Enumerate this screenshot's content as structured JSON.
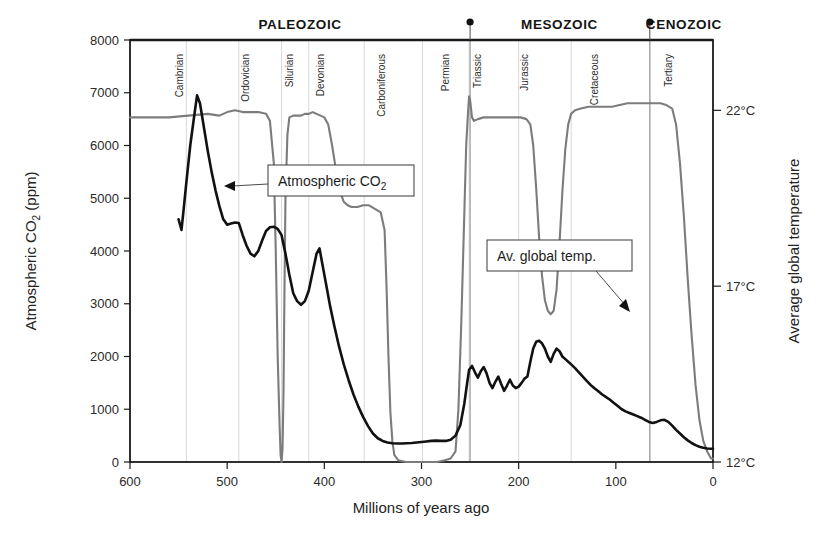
{
  "chart_data": {
    "type": "line",
    "title": "",
    "xlabel": "Millions of years ago",
    "ylabel": "Atmospheric CO₂ (ppm)",
    "ylabel_right": "Average global temperature",
    "xlim": [
      600,
      0
    ],
    "ylim": [
      0,
      8000
    ],
    "ylim_right": [
      12,
      24
    ],
    "x_reversed": true,
    "grid": true,
    "legend_position": "inline-callouts",
    "xticks": [
      600,
      500,
      400,
      300,
      200,
      100,
      0
    ],
    "xtick_labels": [
      "600",
      "500",
      "400",
      "300",
      "200",
      "100",
      "0"
    ],
    "yticks": [
      0,
      1000,
      2000,
      3000,
      4000,
      5000,
      6000,
      7000,
      8000
    ],
    "ytick_labels": [
      "0",
      "1000",
      "2000",
      "3000",
      "4000",
      "5000",
      "6000",
      "7000",
      "8000"
    ],
    "yticks_right": [
      12,
      17,
      22
    ],
    "ytick_labels_right": [
      "12°C",
      "17°C",
      "22°C"
    ],
    "eras": [
      {
        "name": "PALEOZOIC",
        "start": 600,
        "end": 250,
        "label_x": 425
      },
      {
        "name": "MESOZOIC",
        "start": 250,
        "end": 65,
        "label_x": 158
      },
      {
        "name": "CENOZOIC",
        "start": 65,
        "end": 0,
        "label_x": 30
      }
    ],
    "era_boundary_markers": [
      250,
      65
    ],
    "periods": [
      {
        "name": "Cambrian",
        "start": 542,
        "end": 488,
        "label_x": 545
      },
      {
        "name": "Ordovician",
        "start": 488,
        "end": 444,
        "label_x": 478
      },
      {
        "name": "Silurian",
        "start": 444,
        "end": 416,
        "label_x": 432
      },
      {
        "name": "Devonian",
        "start": 416,
        "end": 359,
        "label_x": 400
      },
      {
        "name": "Carboniferous",
        "start": 359,
        "end": 299,
        "label_x": 338
      },
      {
        "name": "Permian",
        "start": 299,
        "end": 251,
        "label_x": 272
      },
      {
        "name": "Triassic",
        "start": 251,
        "end": 200,
        "label_x": 239
      },
      {
        "name": "Jurassic",
        "start": 200,
        "end": 146,
        "label_x": 190
      },
      {
        "name": "Cretaceous",
        "start": 146,
        "end": 65,
        "label_x": 118
      },
      {
        "name": "Tertiary",
        "start": 65,
        "end": 2,
        "label_x": 42
      }
    ],
    "period_boundaries": [
      542,
      488,
      444,
      416,
      359,
      299,
      251,
      200,
      146,
      65
    ],
    "series": [
      {
        "name": "Atmospheric CO₂",
        "unit": "ppm",
        "axis": "left",
        "color": "#111111",
        "points": [
          [
            550,
            4600
          ],
          [
            547,
            4400
          ],
          [
            545,
            4750
          ],
          [
            542,
            5300
          ],
          [
            538,
            6000
          ],
          [
            534,
            6550
          ],
          [
            531,
            6950
          ],
          [
            528,
            6800
          ],
          [
            524,
            6350
          ],
          [
            520,
            5900
          ],
          [
            516,
            5500
          ],
          [
            512,
            5150
          ],
          [
            508,
            4850
          ],
          [
            504,
            4600
          ],
          [
            500,
            4500
          ],
          [
            496,
            4520
          ],
          [
            492,
            4540
          ],
          [
            488,
            4530
          ],
          [
            484,
            4300
          ],
          [
            480,
            4100
          ],
          [
            476,
            3950
          ],
          [
            472,
            3900
          ],
          [
            468,
            4000
          ],
          [
            464,
            4200
          ],
          [
            460,
            4380
          ],
          [
            456,
            4450
          ],
          [
            452,
            4460
          ],
          [
            448,
            4420
          ],
          [
            444,
            4300
          ],
          [
            440,
            3950
          ],
          [
            436,
            3550
          ],
          [
            432,
            3200
          ],
          [
            428,
            3050
          ],
          [
            424,
            2980
          ],
          [
            420,
            3050
          ],
          [
            416,
            3250
          ],
          [
            412,
            3600
          ],
          [
            408,
            3950
          ],
          [
            405,
            4050
          ],
          [
            402,
            3750
          ],
          [
            398,
            3350
          ],
          [
            394,
            2950
          ],
          [
            390,
            2600
          ],
          [
            385,
            2200
          ],
          [
            380,
            1850
          ],
          [
            375,
            1550
          ],
          [
            370,
            1280
          ],
          [
            365,
            1050
          ],
          [
            360,
            850
          ],
          [
            355,
            680
          ],
          [
            350,
            540
          ],
          [
            345,
            450
          ],
          [
            340,
            400
          ],
          [
            335,
            370
          ],
          [
            330,
            355
          ],
          [
            325,
            350
          ],
          [
            320,
            350
          ],
          [
            315,
            355
          ],
          [
            310,
            360
          ],
          [
            305,
            370
          ],
          [
            300,
            380
          ],
          [
            295,
            390
          ],
          [
            290,
            400
          ],
          [
            285,
            405
          ],
          [
            280,
            400
          ],
          [
            275,
            400
          ],
          [
            270,
            420
          ],
          [
            265,
            500
          ],
          [
            260,
            700
          ],
          [
            256,
            1100
          ],
          [
            253,
            1500
          ],
          [
            251,
            1750
          ],
          [
            248,
            1820
          ],
          [
            245,
            1700
          ],
          [
            242,
            1600
          ],
          [
            239,
            1720
          ],
          [
            236,
            1800
          ],
          [
            233,
            1680
          ],
          [
            230,
            1500
          ],
          [
            227,
            1400
          ],
          [
            224,
            1520
          ],
          [
            221,
            1620
          ],
          [
            218,
            1480
          ],
          [
            215,
            1350
          ],
          [
            212,
            1450
          ],
          [
            209,
            1560
          ],
          [
            206,
            1450
          ],
          [
            203,
            1400
          ],
          [
            200,
            1430
          ],
          [
            197,
            1500
          ],
          [
            194,
            1580
          ],
          [
            191,
            1620
          ],
          [
            188,
            1900
          ],
          [
            185,
            2150
          ],
          [
            182,
            2280
          ],
          [
            179,
            2300
          ],
          [
            176,
            2250
          ],
          [
            173,
            2150
          ],
          [
            170,
            2000
          ],
          [
            167,
            1900
          ],
          [
            164,
            2050
          ],
          [
            161,
            2150
          ],
          [
            158,
            2100
          ],
          [
            155,
            2000
          ],
          [
            152,
            1950
          ],
          [
            149,
            1900
          ],
          [
            146,
            1850
          ],
          [
            142,
            1780
          ],
          [
            138,
            1700
          ],
          [
            134,
            1620
          ],
          [
            130,
            1540
          ],
          [
            126,
            1460
          ],
          [
            122,
            1400
          ],
          [
            118,
            1340
          ],
          [
            114,
            1280
          ],
          [
            110,
            1230
          ],
          [
            106,
            1180
          ],
          [
            102,
            1120
          ],
          [
            98,
            1060
          ],
          [
            94,
            1000
          ],
          [
            90,
            960
          ],
          [
            86,
            930
          ],
          [
            82,
            900
          ],
          [
            78,
            870
          ],
          [
            74,
            840
          ],
          [
            70,
            800
          ],
          [
            66,
            760
          ],
          [
            62,
            740
          ],
          [
            58,
            760
          ],
          [
            54,
            790
          ],
          [
            50,
            800
          ],
          [
            46,
            760
          ],
          [
            42,
            690
          ],
          [
            38,
            610
          ],
          [
            34,
            540
          ],
          [
            30,
            470
          ],
          [
            26,
            410
          ],
          [
            22,
            360
          ],
          [
            18,
            320
          ],
          [
            14,
            290
          ],
          [
            10,
            270
          ],
          [
            6,
            255
          ],
          [
            2,
            250
          ],
          [
            0,
            250
          ]
        ]
      },
      {
        "name": "Av. global temp.",
        "unit": "°C",
        "axis": "right",
        "color": "#7c7c7c",
        "points": [
          [
            600,
            21.8
          ],
          [
            580,
            21.8
          ],
          [
            560,
            21.8
          ],
          [
            540,
            21.85
          ],
          [
            520,
            21.9
          ],
          [
            508,
            21.85
          ],
          [
            500,
            21.95
          ],
          [
            492,
            22.0
          ],
          [
            484,
            21.95
          ],
          [
            476,
            21.95
          ],
          [
            468,
            21.95
          ],
          [
            460,
            21.9
          ],
          [
            456,
            21.7
          ],
          [
            452,
            20.5
          ],
          [
            450,
            18.0
          ],
          [
            448,
            15.0
          ],
          [
            446,
            13.0
          ],
          [
            445,
            12.2
          ],
          [
            444,
            12.0
          ],
          [
            443,
            12.4
          ],
          [
            442,
            14.0
          ],
          [
            441,
            17.0
          ],
          [
            440,
            19.5
          ],
          [
            438,
            21.3
          ],
          [
            436,
            21.8
          ],
          [
            432,
            21.85
          ],
          [
            428,
            21.85
          ],
          [
            424,
            21.85
          ],
          [
            420,
            21.9
          ],
          [
            416,
            21.9
          ],
          [
            412,
            21.95
          ],
          [
            408,
            21.9
          ],
          [
            404,
            21.85
          ],
          [
            400,
            21.8
          ],
          [
            396,
            21.6
          ],
          [
            392,
            21.0
          ],
          [
            388,
            20.3
          ],
          [
            384,
            19.7
          ],
          [
            380,
            19.4
          ],
          [
            376,
            19.3
          ],
          [
            372,
            19.25
          ],
          [
            366,
            19.25
          ],
          [
            360,
            19.3
          ],
          [
            354,
            19.3
          ],
          [
            348,
            19.2
          ],
          [
            342,
            19.1
          ],
          [
            338,
            18.6
          ],
          [
            336,
            17.0
          ],
          [
            334,
            15.0
          ],
          [
            332,
            13.4
          ],
          [
            330,
            12.6
          ],
          [
            328,
            12.2
          ],
          [
            324,
            12.05
          ],
          [
            316,
            12.0
          ],
          [
            308,
            12.0
          ],
          [
            300,
            12.0
          ],
          [
            292,
            12.0
          ],
          [
            284,
            12.0
          ],
          [
            276,
            12.05
          ],
          [
            270,
            12.1
          ],
          [
            265,
            12.3
          ],
          [
            262,
            13.5
          ],
          [
            259,
            16.0
          ],
          [
            256,
            19.0
          ],
          [
            254,
            21.0
          ],
          [
            252,
            22.0
          ],
          [
            251,
            22.4
          ],
          [
            250,
            22.3
          ],
          [
            248,
            21.8
          ],
          [
            246,
            21.7
          ],
          [
            242,
            21.75
          ],
          [
            236,
            21.8
          ],
          [
            228,
            21.8
          ],
          [
            220,
            21.8
          ],
          [
            212,
            21.8
          ],
          [
            204,
            21.8
          ],
          [
            198,
            21.8
          ],
          [
            192,
            21.75
          ],
          [
            188,
            21.6
          ],
          [
            185,
            21.0
          ],
          [
            182,
            19.8
          ],
          [
            179,
            18.4
          ],
          [
            176,
            17.3
          ],
          [
            173,
            16.6
          ],
          [
            170,
            16.3
          ],
          [
            167,
            16.2
          ],
          [
            164,
            16.3
          ],
          [
            161,
            16.9
          ],
          [
            158,
            18.2
          ],
          [
            155,
            19.7
          ],
          [
            152,
            20.9
          ],
          [
            149,
            21.6
          ],
          [
            146,
            21.9
          ],
          [
            142,
            22.0
          ],
          [
            136,
            22.05
          ],
          [
            128,
            22.1
          ],
          [
            120,
            22.1
          ],
          [
            112,
            22.1
          ],
          [
            104,
            22.1
          ],
          [
            96,
            22.15
          ],
          [
            88,
            22.2
          ],
          [
            80,
            22.2
          ],
          [
            72,
            22.2
          ],
          [
            66,
            22.2
          ],
          [
            60,
            22.2
          ],
          [
            54,
            22.2
          ],
          [
            48,
            22.15
          ],
          [
            42,
            22.05
          ],
          [
            38,
            21.6
          ],
          [
            34,
            20.5
          ],
          [
            30,
            19.0
          ],
          [
            26,
            17.2
          ],
          [
            22,
            15.6
          ],
          [
            18,
            14.2
          ],
          [
            14,
            13.2
          ],
          [
            10,
            12.6
          ],
          [
            6,
            12.3
          ],
          [
            2,
            12.1
          ],
          [
            0,
            12.1
          ]
        ]
      }
    ],
    "annotations": [
      {
        "text": "Atmospheric CO₂",
        "target_x": 520,
        "target_y": 5350
      },
      {
        "text": "Av. global temp.",
        "target_x": 128,
        "target_y": 22.1
      }
    ]
  },
  "axes": {
    "left_title": "Atmospheric CO",
    "left_title_sub": "2",
    "left_title_tail": " (ppm)",
    "right_title": "Average global temperature",
    "x_title": "Millions of years ago"
  },
  "callouts": {
    "co2": {
      "text_main": "Atmospheric CO",
      "text_sub": "2"
    },
    "temp": {
      "text": "Av. global temp."
    }
  },
  "colors": {
    "co2_line": "#111111",
    "temp_line": "#7c7c7c",
    "axis": "#1b1b1b",
    "grid": "#d8d8d8",
    "era_rule": "#9a9a9a",
    "background": "#ffffff"
  }
}
